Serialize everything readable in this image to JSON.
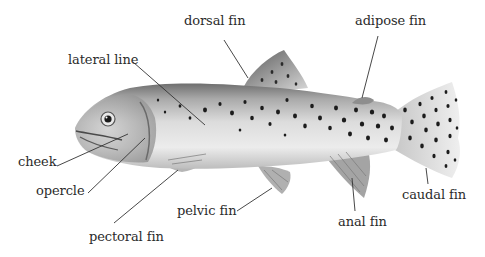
{
  "diagram": {
    "colors": {
      "background": "#ffffff",
      "label_text": "#2b2b2b",
      "leader_line": "#333333",
      "body_light": "#e4e4e4",
      "body_dark": "#7a7a7a",
      "spots": "#1a1a1a"
    },
    "labels": [
      {
        "id": "dorsal-fin",
        "text": "dorsal fin",
        "x": 184,
        "y": 14,
        "target": [
          255,
          78
        ]
      },
      {
        "id": "adipose-fin",
        "text": "adipose fin",
        "x": 355,
        "y": 14,
        "target": [
          362,
          98
        ]
      },
      {
        "id": "lateral-line",
        "text": "lateral line",
        "x": 68,
        "y": 53,
        "target": [
          205,
          125
        ]
      },
      {
        "id": "cheek",
        "text": "cheek",
        "x": 18,
        "y": 155,
        "target": [
          128,
          132
        ]
      },
      {
        "id": "opercle",
        "text": "opercle",
        "x": 36,
        "y": 184,
        "target": [
          145,
          135
        ]
      },
      {
        "id": "pelvic-fin",
        "text": "pelvic fin",
        "x": 177,
        "y": 206,
        "target": [
          272,
          188
        ]
      },
      {
        "id": "pectoral-fin",
        "text": "pectoral fin",
        "x": 89,
        "y": 232,
        "target": [
          182,
          170
        ]
      },
      {
        "id": "anal-fin",
        "text": "anal fin",
        "x": 338,
        "y": 217,
        "target": [
          355,
          178
        ]
      },
      {
        "id": "caudal-fin",
        "text": "caudal fin",
        "x": 403,
        "y": 190,
        "target": [
          425,
          168
        ]
      }
    ]
  }
}
